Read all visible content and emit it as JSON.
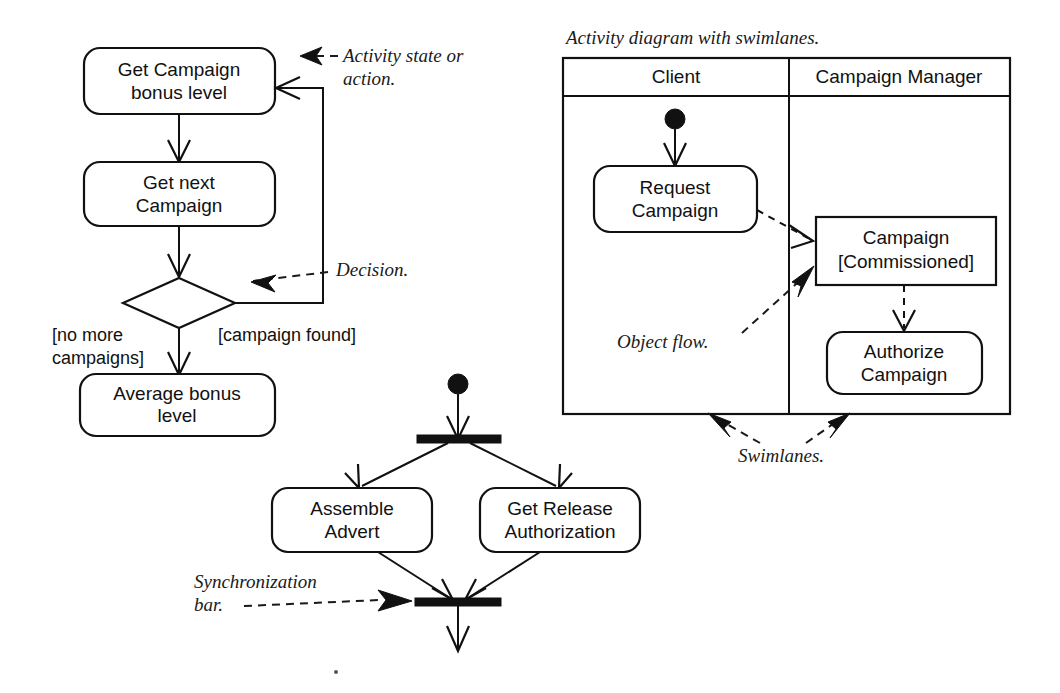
{
  "page": {
    "width": 1060,
    "height": 693,
    "background": "#ffffff",
    "ink": "#111111"
  },
  "left_diagram": {
    "name": "campaign-bonus-activity-diagram",
    "nodes": [
      {
        "id": "get-campaign-bonus-level",
        "type": "activity",
        "label_line1": "Get Campaign",
        "label_line2": "bonus level"
      },
      {
        "id": "get-next-campaign",
        "type": "activity",
        "label_line1": "Get next",
        "label_line2": "Campaign"
      },
      {
        "id": "decision",
        "type": "decision",
        "label_line1": "",
        "label_line2": ""
      },
      {
        "id": "average-bonus-level",
        "type": "activity",
        "label_line1": "Average bonus",
        "label_line2": "level"
      }
    ],
    "guards": [
      {
        "id": "guard-no-more-campaigns",
        "line1": "[no more",
        "line2": "campaigns]"
      },
      {
        "id": "guard-campaign-found",
        "line1": "[campaign found]",
        "line2": ""
      }
    ]
  },
  "bottom_diagram": {
    "name": "fork-join-activity-diagram",
    "nodes": [
      {
        "id": "initial-node",
        "type": "initial",
        "label_line1": "",
        "label_line2": ""
      },
      {
        "id": "fork-bar",
        "type": "synchronization-bar",
        "label_line1": "",
        "label_line2": ""
      },
      {
        "id": "assemble-advert",
        "type": "activity",
        "label_line1": "Assemble",
        "label_line2": "Advert"
      },
      {
        "id": "get-release-authorization",
        "type": "activity",
        "label_line1": "Get Release",
        "label_line2": "Authorization"
      },
      {
        "id": "join-bar",
        "type": "synchronization-bar",
        "label_line1": "",
        "label_line2": ""
      }
    ]
  },
  "swimlane_diagram": {
    "name": "swimlane-activity-diagram",
    "caption": "Activity diagram with swimlanes.",
    "lanes": [
      {
        "id": "lane-client",
        "title": "Client"
      },
      {
        "id": "lane-campaign-manager",
        "title": "Campaign Manager"
      }
    ],
    "nodes": [
      {
        "id": "initial-node",
        "type": "initial",
        "label_line1": "",
        "label_line2": ""
      },
      {
        "id": "request-campaign",
        "type": "activity",
        "label_line1": "Request",
        "label_line2": "Campaign"
      },
      {
        "id": "campaign-commissioned",
        "type": "object",
        "label_line1": "Campaign",
        "label_line2": "[Commissioned]"
      },
      {
        "id": "authorize-campaign",
        "type": "activity",
        "label_line1": "Authorize",
        "label_line2": "Campaign"
      }
    ]
  },
  "annotations": [
    {
      "id": "annot-activity-state",
      "line1": "Activity state or",
      "line2": "action."
    },
    {
      "id": "annot-decision",
      "line1": "Decision.",
      "line2": ""
    },
    {
      "id": "annot-object-flow",
      "line1": "Object flow.",
      "line2": ""
    },
    {
      "id": "annot-swimlanes",
      "line1": "Swimlanes.",
      "line2": ""
    },
    {
      "id": "annot-synchronization-bar",
      "line1": "Synchronization",
      "line2": "bar."
    }
  ]
}
